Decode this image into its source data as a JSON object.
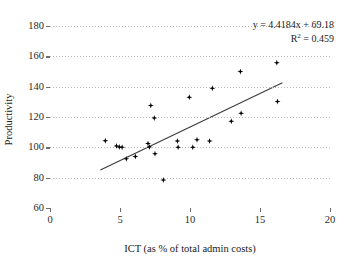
{
  "chart_data": {
    "type": "scatter",
    "title": "",
    "xlabel": "ICT (as % of total admin costs)",
    "ylabel": "Productivity",
    "xlim": [
      0,
      20
    ],
    "ylim": [
      60,
      180
    ],
    "xticks": [
      0,
      5,
      10,
      15,
      20
    ],
    "yticks": [
      60,
      80,
      100,
      120,
      140,
      160,
      180
    ],
    "grid": "horizontal-dotted",
    "legend": "none",
    "marker": "filled-diamond",
    "marker_color": "#000000",
    "points": [
      {
        "x": 3.95,
        "y": 104.3
      },
      {
        "x": 4.75,
        "y": 100.9
      },
      {
        "x": 4.95,
        "y": 100.2
      },
      {
        "x": 5.15,
        "y": 100.0
      },
      {
        "x": 5.45,
        "y": 92.4
      },
      {
        "x": 6.1,
        "y": 94.0
      },
      {
        "x": 7.0,
        "y": 102.5
      },
      {
        "x": 7.1,
        "y": 100.2
      },
      {
        "x": 7.2,
        "y": 127.6
      },
      {
        "x": 7.45,
        "y": 119.4
      },
      {
        "x": 7.5,
        "y": 95.8
      },
      {
        "x": 8.1,
        "y": 78.4
      },
      {
        "x": 9.1,
        "y": 104.2
      },
      {
        "x": 9.15,
        "y": 100.1
      },
      {
        "x": 9.95,
        "y": 133.0
      },
      {
        "x": 10.2,
        "y": 100.0
      },
      {
        "x": 10.5,
        "y": 105.0
      },
      {
        "x": 11.4,
        "y": 104.2
      },
      {
        "x": 11.6,
        "y": 139.0
      },
      {
        "x": 12.95,
        "y": 117.2
      },
      {
        "x": 13.6,
        "y": 150.0
      },
      {
        "x": 13.65,
        "y": 122.5
      },
      {
        "x": 16.2,
        "y": 155.7
      },
      {
        "x": 16.25,
        "y": 130.2
      }
    ],
    "trendline": {
      "equation": "y = 4.4184x + 69.18",
      "r2_label": "R",
      "r2_exponent": "2",
      "r2_value": " = 0.459",
      "slope": 4.4184,
      "intercept": 69.18,
      "x_start": 3.6,
      "x_end": 16.6
    }
  },
  "colors": {
    "marker": "#000000",
    "axis": "#6b6b6b",
    "grid": "#b9b9b9",
    "text": "#1a1a1a",
    "background": "#ffffff"
  }
}
